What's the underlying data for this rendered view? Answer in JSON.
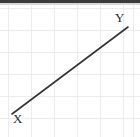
{
  "figure": {
    "title": "",
    "background_color": "#ffffff",
    "top_band_color": "#3a3a3a",
    "grid_color": "#ececec",
    "line_color": "#333333",
    "label_color": "#2b2b2b"
  },
  "labels": {
    "start_label": "X",
    "end_label": "Y"
  },
  "chart_data": {
    "type": "line",
    "title": "",
    "xlabel": "",
    "ylabel": "",
    "grid": true,
    "legend": null,
    "xlim": [
      0,
      140
    ],
    "ylim": [
      0,
      132
    ],
    "annotations": [
      {
        "text": "X",
        "x": 17,
        "y": 114,
        "position": "bottom-left"
      },
      {
        "text": "Y",
        "x": 120,
        "y": 16,
        "position": "top-right"
      }
    ],
    "gridlines": {
      "vertical_x": [
        8,
        31,
        54,
        77,
        100,
        123,
        133
      ],
      "horizontal_y": [
        3,
        25,
        47,
        69,
        91,
        113
      ]
    },
    "series": [
      {
        "name": "XY",
        "x": [
          12,
          128
        ],
        "y": [
          109,
          22
        ],
        "style": "solid",
        "width": 1.6
      }
    ]
  }
}
